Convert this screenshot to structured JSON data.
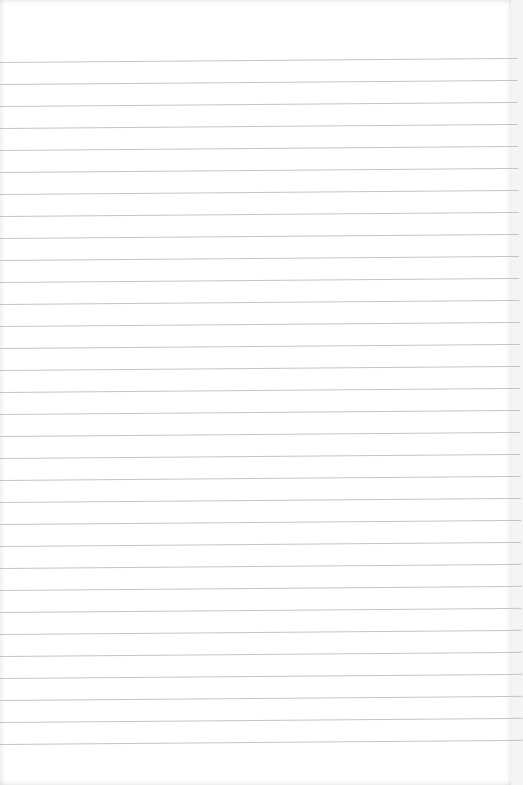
{
  "page": {
    "type": "lined-notebook-page",
    "background_color": "#ffffff",
    "rule_color": "#c4c4c4",
    "rule_count": 32,
    "first_rule_y": 62,
    "rule_spacing": 22,
    "content": ""
  }
}
